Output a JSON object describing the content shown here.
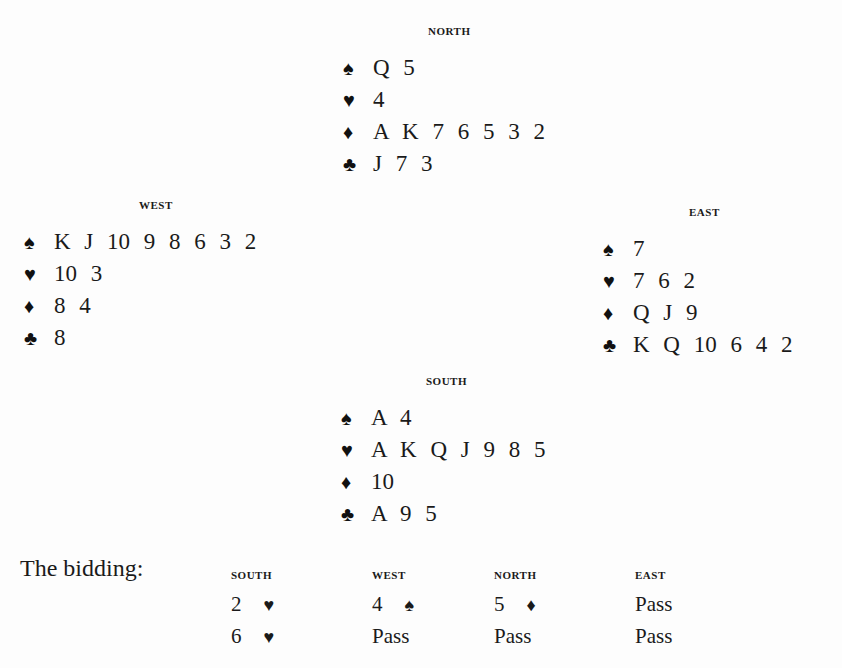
{
  "hands": {
    "north": {
      "label": "NORTH",
      "spades": "Q 5",
      "hearts": "4",
      "diamonds": "A K 7 6 5 3 2",
      "clubs": "J 7 3"
    },
    "west": {
      "label": "WEST",
      "spades": "K J 10 9 8 6 3 2",
      "hearts": "10 3",
      "diamonds": "8 4",
      "clubs": "8"
    },
    "east": {
      "label": "EAST",
      "spades": "7",
      "hearts": "7 6 2",
      "diamonds": "Q J 9",
      "clubs": "K Q 10 6 4 2"
    },
    "south": {
      "label": "SOUTH",
      "spades": "A 4",
      "hearts": "A K Q J 9 8 5",
      "diamonds": "10",
      "clubs": "A 9 5"
    }
  },
  "suits": {
    "spades": "♠",
    "hearts": "♥",
    "diamonds": "♦",
    "clubs": "♣"
  },
  "bidding": {
    "title": "The bidding:",
    "columns": [
      {
        "header": "SOUTH",
        "bids": [
          {
            "level": "2",
            "suit": "♥"
          },
          {
            "level": "6",
            "suit": "♥"
          }
        ]
      },
      {
        "header": "WEST",
        "bids": [
          {
            "level": "4",
            "suit": "♠"
          },
          {
            "level": "Pass",
            "suit": ""
          }
        ]
      },
      {
        "header": "NORTH",
        "bids": [
          {
            "level": "5",
            "suit": "♦"
          },
          {
            "level": "Pass",
            "suit": ""
          }
        ]
      },
      {
        "header": "EAST",
        "bids": [
          {
            "level": "Pass",
            "suit": ""
          },
          {
            "level": "Pass",
            "suit": ""
          }
        ]
      }
    ]
  }
}
